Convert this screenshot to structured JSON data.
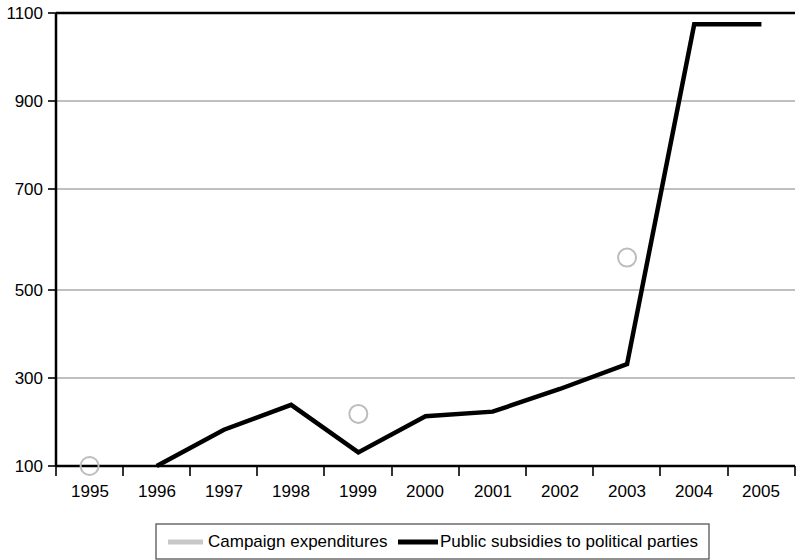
{
  "chart_data": {
    "type": "line",
    "title": "",
    "subtitle": "",
    "xlabel": "",
    "ylabel": "",
    "categories": [
      "1995",
      "1996",
      "1997",
      "1998",
      "1999",
      "2000",
      "2001",
      "2002",
      "2003",
      "2004",
      "2005"
    ],
    "x_tick_labels": [
      "1995",
      "1996",
      "1997",
      "1998",
      "1999",
      "2000",
      "2001",
      "2002",
      "2003",
      "2004",
      "2005"
    ],
    "y_tick_labels": [
      "100",
      "300",
      "500",
      "700",
      "900",
      "1100"
    ],
    "y_ticks": [
      100,
      300,
      500,
      700,
      900,
      1100
    ],
    "ylim": [
      100,
      1100
    ],
    "grid": true,
    "legend_position": "bottom",
    "series": [
      {
        "name": "Campaign expenditures",
        "color": "#c8c8c8",
        "marker": "circle-open",
        "values": [
          100,
          null,
          null,
          null,
          215,
          null,
          null,
          null,
          560,
          null,
          null
        ],
        "marker_points": [
          {
            "category": "1995",
            "value": 100
          },
          {
            "category": "1999",
            "value": 215
          },
          {
            "category": "2003",
            "value": 560
          }
        ]
      },
      {
        "name": "Public subsidies to political parties",
        "color": "#000000",
        "marker": "none",
        "values": [
          null,
          100,
          180,
          235,
          130,
          210,
          220,
          270,
          325,
          1075,
          1075
        ]
      }
    ]
  },
  "legend": {
    "items": [
      {
        "label": "Campaign expenditures",
        "color": "#c8c8c8"
      },
      {
        "label": "Public subsidies to political parties",
        "color": "#000000"
      }
    ]
  },
  "axes": {
    "y": {
      "ticks": [
        {
          "label": "1100",
          "value": 1100
        },
        {
          "label": "900",
          "value": 900
        },
        {
          "label": "700",
          "value": 700
        },
        {
          "label": "500",
          "value": 500
        },
        {
          "label": "300",
          "value": 300
        },
        {
          "label": "100",
          "value": 100
        }
      ]
    },
    "x": {
      "ticks": [
        {
          "label": "1995"
        },
        {
          "label": "1996"
        },
        {
          "label": "1997"
        },
        {
          "label": "1998"
        },
        {
          "label": "1999"
        },
        {
          "label": "2000"
        },
        {
          "label": "2001"
        },
        {
          "label": "2002"
        },
        {
          "label": "2003"
        },
        {
          "label": "2004"
        },
        {
          "label": "2005"
        }
      ]
    }
  }
}
